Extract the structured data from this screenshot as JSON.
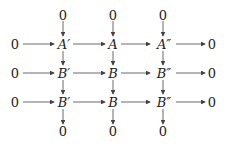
{
  "diagram": {
    "type": "commutative-diagram",
    "top_zeros": [
      "0",
      "0",
      "0"
    ],
    "bottom_zeros": [
      "0",
      "0",
      "0"
    ],
    "rows": [
      {
        "left": "0",
        "nodes": [
          "A′",
          "A",
          "A″"
        ],
        "right": "0"
      },
      {
        "left": "0",
        "nodes": [
          "B′",
          "B",
          "B″"
        ],
        "right": "0"
      },
      {
        "left": "0",
        "nodes": [
          "B′",
          "B",
          "B″"
        ],
        "right": "0"
      }
    ],
    "arrow_color": "#444444"
  }
}
